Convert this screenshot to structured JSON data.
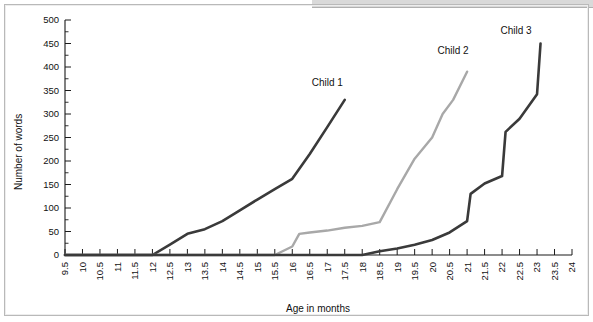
{
  "figure": {
    "title": "",
    "background_color": "#ffffff",
    "frame_color": "#b9b9b9"
  },
  "chart_data": {
    "type": "line",
    "title": "",
    "subtitle": "",
    "xlabel": "Age in months",
    "ylabel": "Number of words",
    "xlim": [
      9.5,
      24
    ],
    "ylim": [
      0,
      500
    ],
    "ytick_step": 50,
    "xtick_step": 0.5,
    "grid": false,
    "legend_position": "inline-end-of-line",
    "xticks": [
      "9.5",
      "10",
      "10.5",
      "11",
      "11.5",
      "12",
      "12.5",
      "13",
      "13.5",
      "14",
      "14.5",
      "15",
      "15.5",
      "16",
      "16.5",
      "17",
      "17.5",
      "18",
      "18.5",
      "19",
      "19.5",
      "20",
      "20.5",
      "21",
      "21.5",
      "22",
      "22.5",
      "23",
      "23.5",
      "24"
    ],
    "yticks": [
      "0",
      "50",
      "100",
      "150",
      "200",
      "250",
      "300",
      "350",
      "400",
      "450",
      "500"
    ],
    "series": [
      {
        "name": "Child 1",
        "color": "#3a3a3a",
        "width": 2.6,
        "label_x": 17.0,
        "label_y": 360,
        "x": [
          9.5,
          12.0,
          12.5,
          13.0,
          13.5,
          14.0,
          14.5,
          15.0,
          15.5,
          16.0,
          16.5,
          17.0,
          17.5
        ],
        "y": [
          0,
          0,
          22,
          45,
          55,
          72,
          95,
          118,
          140,
          162,
          215,
          272,
          330
        ]
      },
      {
        "name": "Child 2",
        "color": "#a8a8a8",
        "width": 2.4,
        "label_x": 20.6,
        "label_y": 428,
        "x": [
          9.5,
          15.5,
          16.0,
          16.2,
          16.5,
          17.0,
          17.5,
          18.0,
          18.5,
          19.0,
          19.5,
          20.0,
          20.3,
          20.6,
          21.0
        ],
        "y": [
          0,
          0,
          18,
          45,
          48,
          52,
          58,
          62,
          70,
          140,
          205,
          250,
          300,
          330,
          390
        ]
      },
      {
        "name": "Child 3",
        "color": "#3a3a3a",
        "width": 2.6,
        "label_x": 22.4,
        "label_y": 470,
        "x": [
          9.5,
          18.0,
          18.5,
          19.0,
          19.5,
          20.0,
          20.5,
          21.0,
          21.1,
          21.5,
          22.0,
          22.1,
          22.5,
          23.0,
          23.1
        ],
        "y": [
          0,
          0,
          8,
          14,
          22,
          32,
          48,
          72,
          130,
          152,
          168,
          262,
          290,
          342,
          450
        ]
      }
    ]
  },
  "axes": {
    "y_axis_label": "Number of words",
    "x_axis_label": "Age in months"
  }
}
